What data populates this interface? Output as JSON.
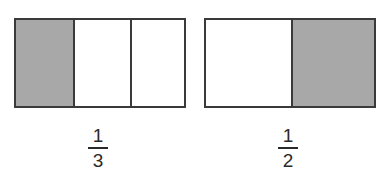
{
  "figures": [
    {
      "name": "thirds-bar",
      "parts": 3,
      "shaded_index": 0,
      "fraction": {
        "numerator": "1",
        "denominator": "3"
      }
    },
    {
      "name": "halves-bar",
      "parts": 2,
      "shaded_index": 1,
      "fraction": {
        "numerator": "1",
        "denominator": "2"
      }
    }
  ],
  "colors": {
    "shaded": "#a8a8a8",
    "unshaded": "#ffffff",
    "border": "#3a3a3a",
    "text": "#2a2a2a"
  }
}
